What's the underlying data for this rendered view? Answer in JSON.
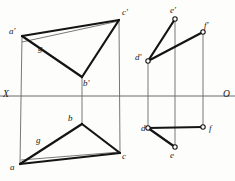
{
  "drawing": {
    "title": "Orthographic two-view projection: triangle a-b-c and segment set d-e-f",
    "colors": {
      "ink": "#141414",
      "thin": "#555555",
      "axis": "#6b6b6b",
      "paper": "#fdfdfc"
    },
    "axis": {
      "left_label": "X",
      "right_label": "O",
      "y": 96,
      "x_start": 0,
      "x_end": 235
    },
    "labels": [
      {
        "name": "label-a-prime",
        "text": "a'",
        "x": 9,
        "y": 27
      },
      {
        "name": "label-b-prime",
        "text": "b'",
        "x": 83,
        "y": 79
      },
      {
        "name": "label-c-prime",
        "text": "c'",
        "x": 122,
        "y": 8
      },
      {
        "name": "label-g-prime",
        "text": "g",
        "x": 38,
        "y": 44
      },
      {
        "name": "label-a",
        "text": "a",
        "x": 10,
        "y": 163
      },
      {
        "name": "label-b",
        "text": "b",
        "x": 68,
        "y": 114
      },
      {
        "name": "label-c",
        "text": "c",
        "x": 122,
        "y": 152
      },
      {
        "name": "label-g",
        "text": "g",
        "x": 36,
        "y": 136
      },
      {
        "name": "label-d-prime",
        "text": "d'",
        "x": 135,
        "y": 53
      },
      {
        "name": "label-e-prime",
        "text": "e'",
        "x": 170,
        "y": 6
      },
      {
        "name": "label-f-prime",
        "text": "f'",
        "x": 204,
        "y": 21
      },
      {
        "name": "label-d",
        "text": "d",
        "x": 141,
        "y": 124
      },
      {
        "name": "label-e",
        "text": "e",
        "x": 170,
        "y": 151
      },
      {
        "name": "label-f",
        "text": "f",
        "x": 209,
        "y": 124
      }
    ],
    "points": {
      "a_prime": {
        "x": 22,
        "y": 36
      },
      "b_prime": {
        "x": 82,
        "y": 77
      },
      "c_prime": {
        "x": 119,
        "y": 20
      },
      "a": {
        "x": 20,
        "y": 164
      },
      "b": {
        "x": 82,
        "y": 124
      },
      "c": {
        "x": 120,
        "y": 153
      },
      "d_prime": {
        "x": 148,
        "y": 61
      },
      "e_prime": {
        "x": 175,
        "y": 19
      },
      "f_prime": {
        "x": 203,
        "y": 32
      },
      "d": {
        "x": 148,
        "y": 128
      },
      "e": {
        "x": 175,
        "y": 147
      },
      "f": {
        "x": 203,
        "y": 127
      }
    },
    "edges_thick": [
      {
        "name": "edge-a-prime-c-prime",
        "from": "a_prime",
        "to": "c_prime"
      },
      {
        "name": "edge-a-prime-b-prime",
        "from": "a_prime",
        "to": "b_prime"
      },
      {
        "name": "edge-b-prime-c-prime",
        "from": "b_prime",
        "to": "c_prime"
      },
      {
        "name": "edge-a-b",
        "from": "a",
        "to": "b"
      },
      {
        "name": "edge-b-c",
        "from": "b",
        "to": "c"
      },
      {
        "name": "edge-a-c",
        "from": "a",
        "to": "c"
      },
      {
        "name": "edge-d-prime-e-prime",
        "from": "d_prime",
        "to": "e_prime"
      },
      {
        "name": "edge-d-prime-f-prime",
        "from": "d_prime",
        "to": "f_prime"
      },
      {
        "name": "edge-d-f",
        "from": "d",
        "to": "f"
      },
      {
        "name": "edge-d-e",
        "from": "d",
        "to": "e"
      }
    ],
    "edges_thin": [
      {
        "name": "auxiliary-line-a-prime-c-prime-to-b-prime",
        "x1": 22,
        "y1": 42,
        "x2": 119,
        "y2": 21
      },
      {
        "name": "auxiliary-line-a-to-c",
        "x1": 21,
        "y1": 160,
        "x2": 120,
        "y2": 152
      }
    ],
    "projectors": [
      {
        "name": "projector-a",
        "x1": 22,
        "y1": 36,
        "x2": 20,
        "y2": 164
      },
      {
        "name": "projector-b",
        "x1": 82,
        "y1": 77,
        "x2": 82,
        "y2": 124
      },
      {
        "name": "projector-c",
        "x1": 119,
        "y1": 20,
        "x2": 120,
        "y2": 153
      },
      {
        "name": "projector-d",
        "x1": 148,
        "y1": 61,
        "x2": 148,
        "y2": 128
      },
      {
        "name": "projector-e",
        "x1": 175,
        "y1": 19,
        "x2": 175,
        "y2": 147
      },
      {
        "name": "projector-f",
        "x1": 203,
        "y1": 32,
        "x2": 203,
        "y2": 127
      }
    ],
    "open_circles": [
      {
        "name": "vertex-marker-d-prime",
        "x": 148,
        "y": 61
      },
      {
        "name": "vertex-marker-e-prime",
        "x": 175,
        "y": 19
      },
      {
        "name": "vertex-marker-f-prime",
        "x": 203,
        "y": 32
      },
      {
        "name": "vertex-marker-d",
        "x": 148,
        "y": 128
      },
      {
        "name": "vertex-marker-e",
        "x": 175,
        "y": 147
      },
      {
        "name": "vertex-marker-f",
        "x": 203,
        "y": 127
      }
    ]
  }
}
